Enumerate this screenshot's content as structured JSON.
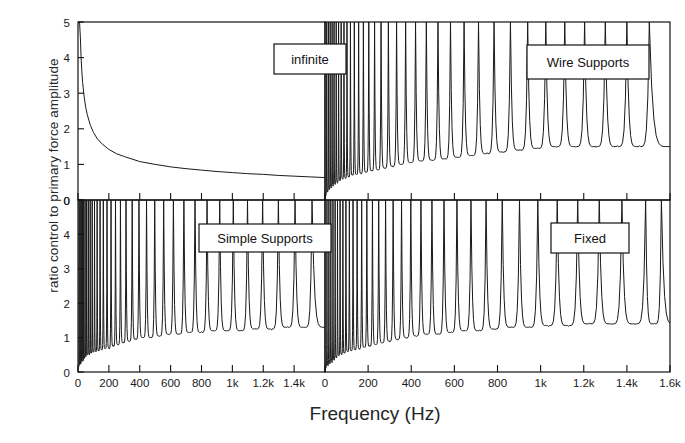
{
  "figure": {
    "ylabel": "ratio control to primary force amplitude",
    "xlabel": "Frequency (Hz)"
  },
  "panels": {
    "top_left": "infinite",
    "top_right": "Wire Supports",
    "bottom_left": "Simple Supports",
    "bottom_right": "Fixed"
  },
  "chart_data": {
    "type": "line",
    "title": "",
    "xlabel": "Frequency (Hz)",
    "ylabel": "ratio control to primary force amplitude",
    "grid": false,
    "legend": "none",
    "layout": "2x2 panel grid, shared axes, inner box labels",
    "panels": [
      {
        "id": "top_left",
        "label": "infinite",
        "row": 0,
        "col": 0,
        "xlim": [
          0,
          1600
        ],
        "ylim": [
          0,
          5
        ],
        "xticks": [
          0,
          200,
          400,
          600,
          800,
          1000,
          1200,
          1400
        ],
        "xticklabels": [
          "0",
          "200",
          "400",
          "600",
          "800",
          "1k",
          "1.2k",
          "1.4k"
        ],
        "yticks": [
          0,
          1,
          2,
          3,
          4,
          5
        ],
        "yticklabels": [
          "0",
          "1",
          "2",
          "3",
          "4",
          "5"
        ],
        "description": "smooth monotonically decreasing curve, infinite beam (no resonances)",
        "series": [
          {
            "name": "infinite",
            "x": [
              5,
              10,
              15,
              20,
              25,
              30,
              40,
              50,
              60,
              80,
              100,
              125,
              150,
              200,
              250,
              300,
              400,
              500,
              600,
              700,
              800,
              900,
              1000,
              1100,
              1200,
              1300,
              1400,
              1500,
              1600
            ],
            "y": [
              5.0,
              5.0,
              4.6,
              4.0,
              3.6,
              3.3,
              2.9,
              2.6,
              2.4,
              2.1,
              1.9,
              1.72,
              1.6,
              1.42,
              1.3,
              1.22,
              1.08,
              1.0,
              0.93,
              0.88,
              0.84,
              0.8,
              0.77,
              0.74,
              0.72,
              0.69,
              0.67,
              0.65,
              0.63
            ]
          }
        ]
      },
      {
        "id": "top_right",
        "label": "Wire Supports",
        "row": 0,
        "col": 1,
        "xlim": [
          0,
          1600
        ],
        "ylim": [
          0,
          5
        ],
        "xticks": [
          0,
          200,
          400,
          600,
          800,
          1000,
          1200,
          1400,
          1600
        ],
        "xticklabels": [
          "0",
          "200",
          "400",
          "600",
          "800",
          "1k",
          "1.2k",
          "1.4k",
          "1.6k"
        ],
        "yticks": [
          0,
          1,
          2,
          3,
          4,
          5
        ],
        "yticklabels": [
          "0",
          "1",
          "2",
          "3",
          "4",
          "5"
        ],
        "description": "dense resonance comb, peaks clipped at 5, antiresonance minima rising toward 1.5 with frequency",
        "resonance_model": {
          "peak_value": 5,
          "peaks_hz": [
            8,
            16,
            24,
            33,
            42,
            52,
            63,
            75,
            88,
            102,
            118,
            136,
            156,
            178,
            203,
            230,
            260,
            294,
            332,
            374,
            420,
            470,
            524,
            582,
            645,
            712,
            784,
            860,
            940,
            1024,
            1112,
            1204,
            1300,
            1400,
            1504
          ],
          "minima": [
            0.25,
            0.3,
            0.35,
            0.4,
            0.45,
            0.5,
            0.55,
            0.6,
            0.62,
            0.65,
            0.7,
            0.72,
            0.75,
            0.78,
            0.82,
            0.85,
            0.9,
            0.95,
            1.0,
            1.05,
            1.1,
            1.12,
            1.15,
            1.2,
            1.25,
            1.3,
            1.35,
            1.4,
            1.45,
            1.5,
            1.5,
            1.5,
            1.5,
            1.5
          ]
        }
      },
      {
        "id": "bottom_left",
        "label": "Simple Supports",
        "row": 1,
        "col": 0,
        "xlim": [
          0,
          1600
        ],
        "ylim": [
          0,
          5
        ],
        "xticks": [
          0,
          200,
          400,
          600,
          800,
          1000,
          1200,
          1400
        ],
        "xticklabels": [
          "0",
          "200",
          "400",
          "600",
          "800",
          "1k",
          "1.2k",
          "1.4k"
        ],
        "yticks": [
          0,
          1,
          2,
          3,
          4,
          5
        ],
        "yticklabels": [
          "0",
          "1",
          "2",
          "3",
          "4",
          "0"
        ],
        "description": "dense resonance comb, peaks clipped at 5, low antiresonance minima near 0.5-1.2",
        "resonance_model": {
          "peak_value": 5,
          "peaks_hz": [
            7,
            14,
            21,
            29,
            37,
            46,
            56,
            67,
            79,
            92,
            107,
            124,
            143,
            164,
            188,
            214,
            243,
            275,
            311,
            351,
            395,
            444,
            497,
            555,
            618,
            686,
            758,
            836,
            918,
            1006,
            1098,
            1196,
            1298,
            1406,
            1516
          ],
          "minima": [
            0.2,
            0.25,
            0.3,
            0.35,
            0.4,
            0.45,
            0.5,
            0.52,
            0.55,
            0.58,
            0.6,
            0.62,
            0.65,
            0.68,
            0.7,
            0.75,
            0.8,
            0.85,
            0.9,
            0.95,
            1.0,
            1.0,
            1.05,
            1.1,
            1.1,
            1.15,
            1.15,
            1.2,
            1.2,
            1.2,
            1.25,
            1.25,
            1.3,
            1.3
          ]
        }
      },
      {
        "id": "bottom_right",
        "label": "Fixed",
        "row": 1,
        "col": 1,
        "xlim": [
          0,
          1600
        ],
        "ylim": [
          0,
          5
        ],
        "xticks": [
          0,
          200,
          400,
          600,
          800,
          1000,
          1200,
          1400,
          1600
        ],
        "xticklabels": [
          "0",
          "200",
          "400",
          "600",
          "800",
          "1k",
          "1.2k",
          "1.4k",
          "1.6k"
        ],
        "yticks": [
          0,
          1,
          2,
          3,
          4,
          5
        ],
        "yticklabels": [
          "0",
          "1",
          "2",
          "3",
          "4",
          "0"
        ],
        "description": "dense resonance comb, peaks clipped at 5, antiresonance minima near 0.5-1.4",
        "resonance_model": {
          "peak_value": 5,
          "peaks_hz": [
            9,
            18,
            27,
            37,
            47,
            58,
            70,
            83,
            97,
            113,
            130,
            149,
            170,
            194,
            220,
            249,
            281,
            316,
            355,
            398,
            445,
            496,
            552,
            612,
            677,
            747,
            822,
            902,
            987,
            1077,
            1172,
            1272,
            1377,
            1487,
            1560
          ],
          "minima": [
            0.2,
            0.25,
            0.3,
            0.35,
            0.42,
            0.48,
            0.52,
            0.55,
            0.6,
            0.62,
            0.65,
            0.68,
            0.72,
            0.75,
            0.8,
            0.85,
            0.9,
            0.95,
            1.0,
            1.05,
            1.1,
            1.1,
            1.15,
            1.2,
            1.2,
            1.25,
            1.3,
            1.3,
            1.35,
            1.35,
            1.4,
            1.4,
            1.4,
            1.4
          ]
        }
      }
    ]
  },
  "colors": {
    "line": "#1a1a1a",
    "axis": "#111111",
    "background": "#ffffff",
    "text": "#1a1a1a"
  }
}
